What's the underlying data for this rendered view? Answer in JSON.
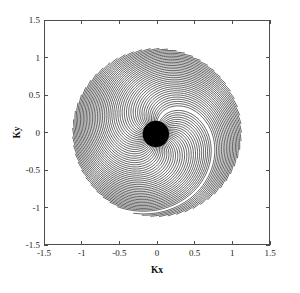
{
  "figure": {
    "background_color": "#ffffff",
    "width": 300,
    "height": 293
  },
  "axes": {
    "box": {
      "left": 44,
      "top": 20,
      "right": 270,
      "bottom": 245
    },
    "frame_color": "#4d4d4d",
    "tick_direction": "in",
    "x_title": "Kx",
    "y_title": "Ky",
    "x_ticks": [
      "-1.5",
      "-1",
      "-0.5",
      "0",
      "0.5",
      "1",
      "1.5"
    ],
    "y_ticks": [
      "1.5",
      "1",
      "0.5",
      "0",
      "-0.5",
      "-1",
      "-1.5"
    ],
    "x_tick_values": [
      -1.5,
      -1,
      -0.5,
      0,
      0.5,
      1,
      1.5
    ],
    "y_tick_values": [
      1.5,
      1,
      0.5,
      0,
      -0.5,
      -1,
      -1.5
    ]
  },
  "chart_data": {
    "type": "line",
    "title": "",
    "xlabel": "Kx",
    "ylabel": "Ky",
    "xlim": [
      -1.5,
      1.5
    ],
    "ylim": [
      -1.5,
      1.5
    ],
    "grid": false,
    "legend": null,
    "plot_kind": "k-space-trajectory",
    "line_color": "#000000",
    "line_width": 0.62,
    "n_interleaves": 60,
    "start_angle_deg": 90,
    "sweep_deg": 354,
    "max_radius": 1.12,
    "spiral_turns": 0.92,
    "radial_density_exponent": 0.56,
    "center_blob_radius": 0.175,
    "center_blob_cx": -0.015,
    "center_blob_cy": -0.02,
    "series": [
      {
        "name": "interleaf-arcs",
        "count": 60,
        "r_start": 0.04,
        "r_end": 1.12,
        "angular_span_deg": 196,
        "rotation_step_deg": 5.9
      }
    ],
    "annotations": []
  }
}
